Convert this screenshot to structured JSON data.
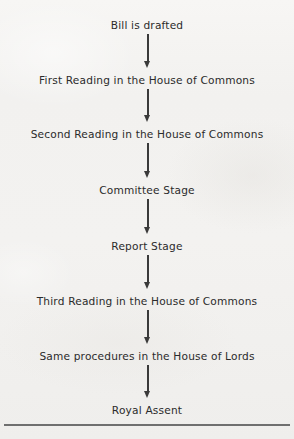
{
  "figure": {
    "background_color": "#f2f1ef",
    "text_color": "#2b2b2b",
    "arrow_color": "#3a3a3a",
    "rule_color": "#6f6f6f",
    "direction": "top-to-bottom"
  },
  "nodes": [
    {
      "label": "Bill is drafted",
      "top": 20
    },
    {
      "label": "First Reading in the House of Commons",
      "top": 75
    },
    {
      "label": "Second Reading in the House of Commons",
      "top": 129
    },
    {
      "label": "Committee Stage",
      "top": 185
    },
    {
      "label": "Report Stage",
      "top": 241
    },
    {
      "label": "Third Reading in the House of Commons",
      "top": 296
    },
    {
      "label": "Same procedures in the House of Lords",
      "top": 351
    },
    {
      "label": "Royal Assent",
      "top": 405
    }
  ],
  "arrows": [
    {
      "name": "arrow-drafted-to-first-reading",
      "top": 34,
      "height": 34
    },
    {
      "name": "arrow-first-to-second-reading",
      "top": 89,
      "height": 33
    },
    {
      "name": "arrow-second-reading-to-committee",
      "top": 143,
      "height": 35
    },
    {
      "name": "arrow-committee-to-report",
      "top": 199,
      "height": 35
    },
    {
      "name": "arrow-report-to-third-reading",
      "top": 255,
      "height": 34
    },
    {
      "name": "arrow-third-reading-to-lords",
      "top": 310,
      "height": 34
    },
    {
      "name": "arrow-lords-to-royal-assent",
      "top": 365,
      "height": 33
    }
  ]
}
